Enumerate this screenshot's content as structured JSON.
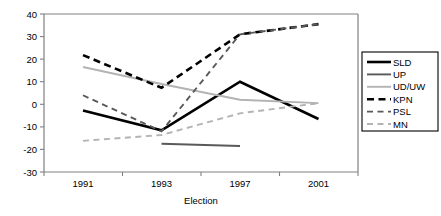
{
  "chart_data": {
    "type": "line",
    "title": "",
    "xlabel": "Election",
    "ylabel": "",
    "categories": [
      "1991",
      "1993",
      "1997",
      "2001"
    ],
    "x": [
      1991,
      1993,
      1997,
      2001
    ],
    "ylim": [
      -30,
      40
    ],
    "yticks": [
      -30,
      -20,
      -10,
      0,
      10,
      20,
      30,
      40
    ],
    "ytick_labels": [
      "-30",
      "-20",
      "-10",
      "0",
      "10",
      "20",
      "30",
      "40"
    ],
    "grid": false,
    "legend_position": "right",
    "series": [
      {
        "name": "SLD",
        "values": [
          -2.8,
          -11.5,
          10.0,
          -6.5
        ],
        "color": "#000000",
        "style": "solid",
        "width": 2.6
      },
      {
        "name": "UP",
        "values": [
          null,
          -17.5,
          -18.5,
          null
        ],
        "color": "#595959",
        "style": "solid",
        "width": 1.9
      },
      {
        "name": "UD/UW",
        "values": [
          16.5,
          9.0,
          2.0,
          0.5
        ],
        "color": "#b3b3b3",
        "style": "solid",
        "width": 1.9
      },
      {
        "name": "KPN",
        "values": [
          21.8,
          7.3,
          31.0,
          35.5
        ],
        "color": "#000000",
        "style": "dashed",
        "width": 2.6
      },
      {
        "name": "PSL",
        "values": [
          4.0,
          -12.0,
          31.0,
          35.5
        ],
        "color": "#595959",
        "style": "dashed",
        "width": 1.9
      },
      {
        "name": "MN",
        "values": [
          -16.2,
          -13.6,
          -4.0,
          0.5
        ],
        "color": "#b3b3b3",
        "style": "dashed",
        "width": 1.9
      }
    ]
  },
  "legend": {
    "entries": [
      "SLD",
      "UP",
      "UD/UW",
      "KPN",
      "PSL",
      "MN"
    ]
  },
  "axes": {
    "x_title": "Election",
    "x_tick_labels": [
      "1991",
      "1993",
      "1997",
      "2001"
    ],
    "y_tick_labels": [
      "40",
      "30",
      "20",
      "10",
      "0",
      "-10",
      "-20",
      "-30"
    ]
  }
}
